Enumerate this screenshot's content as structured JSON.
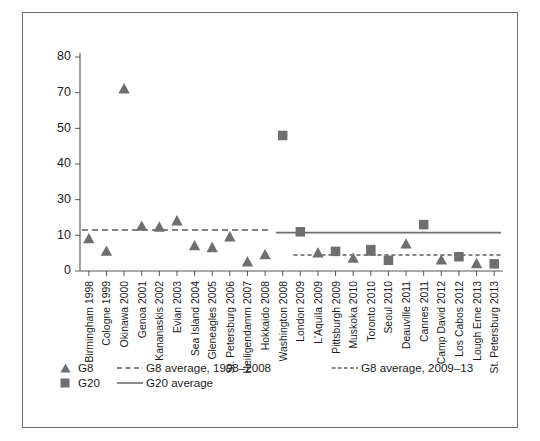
{
  "chart_data": {
    "type": "scatter",
    "title": "",
    "xlabel": "",
    "ylabel": "",
    "ylim": [
      0,
      80
    ],
    "grid": false,
    "legend_position": "bottom-left",
    "ytick_labels": [
      "0",
      "10",
      "30",
      "40",
      "50",
      "70",
      "80"
    ],
    "ytick_values": [
      0,
      10,
      30,
      40,
      50,
      70,
      80
    ],
    "categories": [
      "Birmingham 1998",
      "Cologne 1999",
      "Okinawa 2000",
      "Genoa 2001",
      "Kananaskis 2002",
      "Evian 2003",
      "Sea Island 2004",
      "Gleneagles 2005",
      "St. Petersburg 2006",
      "Heiligendamm 2007",
      "Hokkaido 2008",
      "Washington 2008",
      "London 2009",
      "L'Aquila 2009",
      "Pittsburgh 2009",
      "Muskoka 2010",
      "Toronto 2010",
      "Seoul 2010",
      "Deauville 2011",
      "Cannes 2011",
      "Camp David 2012",
      "Los Cabos 2012",
      "Lough Erne 2013",
      "St. Petersburg 2013"
    ],
    "series": [
      {
        "name": "G8",
        "marker": "triangle",
        "color": "#6f6f6f",
        "points": [
          {
            "category": "Birmingham 1998",
            "value": 9
          },
          {
            "category": "Cologne 1999",
            "value": 5.5
          },
          {
            "category": "Okinawa 2000",
            "value": 71
          },
          {
            "category": "Genoa 2001",
            "value": 15
          },
          {
            "category": "Kananaskis 2002",
            "value": 14.5
          },
          {
            "category": "Evian 2003",
            "value": 18
          },
          {
            "category": "Sea Island 2004",
            "value": 7
          },
          {
            "category": "Gleneagles 2005",
            "value": 6.5
          },
          {
            "category": "St. Petersburg 2006",
            "value": 9.5
          },
          {
            "category": "Heiligendamm 2007",
            "value": 2.5
          },
          {
            "category": "Hokkaido 2008",
            "value": 4.5
          },
          {
            "category": "L'Aquila 2009",
            "value": 5
          },
          {
            "category": "Muskoka 2010",
            "value": 3.5
          },
          {
            "category": "Toronto 2010",
            "value": 5.5
          },
          {
            "category": "Deauville 2011",
            "value": 7.5
          },
          {
            "category": "Camp David 2012",
            "value": 3
          },
          {
            "category": "Lough Erne 2013",
            "value": 2
          }
        ]
      },
      {
        "name": "G20",
        "marker": "square",
        "color": "#6f6f6f",
        "points": [
          {
            "category": "Washington 2008",
            "value": 48
          },
          {
            "category": "London 2009",
            "value": 12
          },
          {
            "category": "Pittsburgh 2009",
            "value": 5.5
          },
          {
            "category": "Toronto 2010",
            "value": 6
          },
          {
            "category": "Seoul 2010",
            "value": 3
          },
          {
            "category": "Cannes 2011",
            "value": 16
          },
          {
            "category": "Los Cabos 2012",
            "value": 4
          },
          {
            "category": "St. Petersburg 2013",
            "value": 2
          }
        ]
      }
    ],
    "reference_lines": [
      {
        "name": "G8 average, 1998–2008",
        "style": "dashed",
        "value": 13,
        "from_category": "Birmingham 1998",
        "to_category": "Hokkaido 2008"
      },
      {
        "name": "G8 average, 2009–13",
        "style": "dashed",
        "value": 4.5,
        "from_category": "London 2009",
        "to_category": "St. Petersburg 2013"
      },
      {
        "name": "G20 average",
        "style": "solid",
        "value": 11.5,
        "from_category": "Washington 2008",
        "to_category": "St. Petersburg 2013"
      }
    ]
  },
  "legend": {
    "items": [
      {
        "symbol": "triangle",
        "label": "G8"
      },
      {
        "symbol": "square",
        "label": "G20"
      },
      {
        "symbol": "dashed-line",
        "label": "G8 average, 1998–2008"
      },
      {
        "symbol": "solid-line",
        "label": "G20 average"
      },
      {
        "symbol": "dashed-line-fine",
        "label": "G8 average, 2009–13"
      }
    ]
  },
  "colors": {
    "marker": "#6f6f6f",
    "axis": "#555555",
    "border": "#6d6d6d",
    "text": "#1b1b1b"
  }
}
